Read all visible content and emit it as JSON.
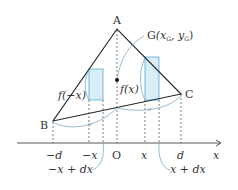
{
  "diagram": {
    "type": "centroid-of-triangle",
    "colors": {
      "line": "#222222",
      "bar_fill": "#d8eef6",
      "bar_stroke": "#5aa9cf",
      "brace": "#6a9fc0",
      "axis": "#444444"
    },
    "vertices": {
      "A": {
        "label": "A"
      },
      "B": {
        "label": "B"
      },
      "C": {
        "label": "C"
      }
    },
    "centroid": {
      "label_main": "G",
      "label_coords": "(x",
      "sub1": "G",
      "comma": ", y",
      "sub2": "G",
      "close": ")"
    },
    "function_labels": {
      "left": "f(−x)",
      "right": "f(x)"
    },
    "axis": {
      "name": "x",
      "ticks": [
        "−d",
        "−x",
        "O",
        "x",
        "d"
      ]
    },
    "annotations": {
      "left_width": "−x + dx",
      "right_width": "x + dx",
      "equal_mark": "〃"
    }
  }
}
